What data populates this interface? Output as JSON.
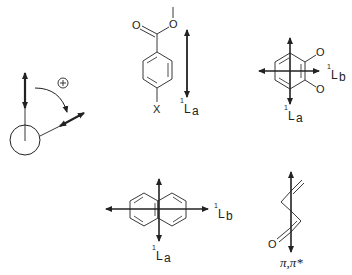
{
  "diagram": {
    "type": "chemistry-transition-dipole-figure",
    "colors": {
      "ink": "#222222",
      "background": "#ffffff"
    },
    "panels": [
      {
        "id": "rotation-convention",
        "description": "Sign convention for transition moment rotation",
        "sign_symbol": "+",
        "elements": [
          "vertical-double-arrow",
          "curved-rotation-arrow",
          "circle",
          "tilted-double-arrow"
        ]
      },
      {
        "id": "benzoate",
        "description": "para-substituted methyl benzoate with 1La polarization",
        "atoms": {
          "carbonyl_oxygen": "O",
          "ester_oxygen": "O",
          "substituent": "X"
        },
        "band": {
          "sup": "1",
          "main": "L",
          "sub": "a"
        }
      },
      {
        "id": "quinone",
        "description": "ortho-quinone type ring with 1La and 1Lb polarizations",
        "atoms": {
          "o1": "O",
          "o2": "O"
        },
        "band_b": {
          "sup": "1",
          "main": "L",
          "sub": "b"
        },
        "band_a": {
          "sup": "1",
          "main": "L",
          "sub": "a"
        }
      },
      {
        "id": "naphthalene",
        "description": "Naphthalene with 1La and 1Lb polarizations",
        "band_b": {
          "sup": "1",
          "main": "L",
          "sub": "b"
        },
        "band_a": {
          "sup": "1",
          "main": "L",
          "sub": "a"
        }
      },
      {
        "id": "enone",
        "description": "Enone chromophore with pi,pi* polarization",
        "atoms": {
          "oxygen": "O"
        },
        "band": {
          "label": "π,π*"
        }
      }
    ]
  }
}
